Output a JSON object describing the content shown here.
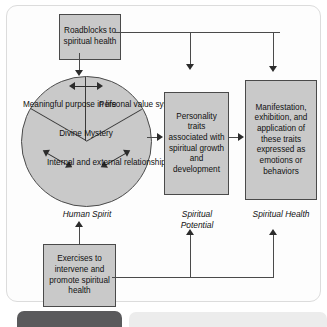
{
  "diagram": {
    "boxes": {
      "roadblocks": "Roadblocks to spiritual health",
      "personality": "Personality traits associated with spiritual growth and development",
      "manifestation": "Manifestation, exhibition, and application of these traits expressed as emotions or behaviors",
      "exercises": "Exercises to intervene and promote spiritual health"
    },
    "circle": {
      "center_label": "Divine Mystery",
      "sectors": [
        "Meaningful purpose in life",
        "Personal value system",
        "Internal and external relationships"
      ]
    },
    "stage_labels": [
      "Human Spirit",
      "Spiritual Potential",
      "Spiritual Health"
    ],
    "colors": {
      "box_fill": "#c9c9c9",
      "box_border": "#4a4a4a",
      "connector": "#2c2c2c",
      "panel_bg": "#fdfdfd",
      "panel_border": "#dcdcdc",
      "bottom_bar_dark": "#5a5a5c",
      "bottom_bar_light": "#ececec"
    }
  }
}
